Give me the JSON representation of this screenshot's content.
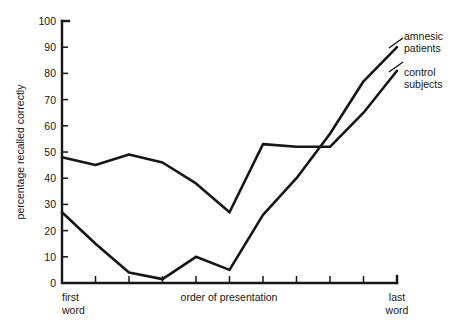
{
  "chart_data": {
    "type": "line",
    "title": "",
    "xlabel": "order of presentation",
    "ylabel": "percentage recalled correctly",
    "x": [
      1,
      2,
      3,
      4,
      5,
      6,
      7,
      8,
      9,
      10,
      11
    ],
    "xtick_labels": [
      "first\nword",
      "",
      "",
      "",
      "",
      "",
      "",
      "",
      "",
      "",
      "last\nword"
    ],
    "x_start_label_line1": "first",
    "x_start_label_line2": "word",
    "x_end_label_line1": "last",
    "x_end_label_line2": "word",
    "ylim": [
      0,
      100
    ],
    "ytick_values": [
      0,
      10,
      20,
      30,
      40,
      50,
      60,
      70,
      80,
      90,
      100
    ],
    "ytick_labels": [
      "0",
      "10",
      "20",
      "30",
      "40",
      "50",
      "60",
      "70",
      "80",
      "90",
      "100"
    ],
    "grid": false,
    "legend_position": "right-inline",
    "series": [
      {
        "name": "amnesic patients",
        "label_line1": "amnesic",
        "label_line2": "patients",
        "color": "#161616",
        "values": [
          27,
          15,
          4,
          1.5,
          10,
          5,
          26,
          40,
          57,
          77,
          90
        ]
      },
      {
        "name": "control subjects",
        "label_line1": "control",
        "label_line2": "subjects",
        "color": "#161616",
        "values": [
          48,
          45,
          49,
          46,
          38,
          27,
          53,
          52,
          52,
          65,
          81
        ]
      }
    ]
  },
  "axes": {
    "y_axis_title": "percentage recalled correctly",
    "x_axis_title": "order of presentation"
  },
  "legend": {
    "entries": [
      {
        "line1": "amnesic",
        "line2": "patients"
      },
      {
        "line1": "control",
        "line2": "subjects"
      }
    ]
  },
  "colors": {
    "ink": "#161616",
    "background": "#ffffff"
  }
}
